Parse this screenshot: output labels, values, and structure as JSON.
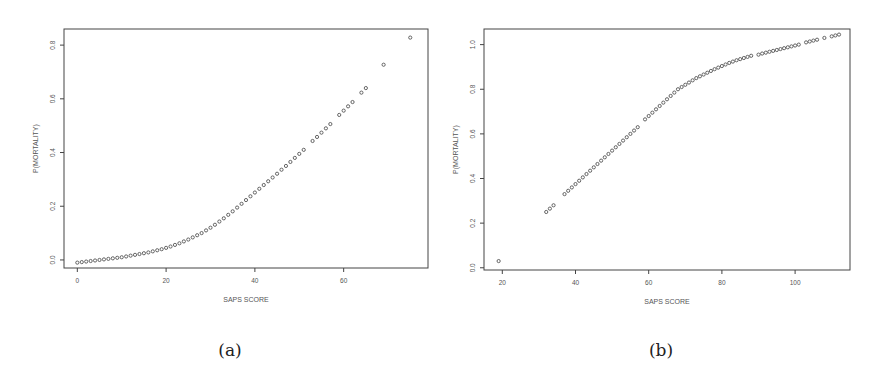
{
  "captions": {
    "a": "(a)",
    "b": "(b)"
  },
  "colors": {
    "frame": "#444444",
    "point": "#555555",
    "text": "#555555"
  },
  "chart_data": [
    {
      "type": "scatter",
      "title": "",
      "xlabel": "SAPS SCORE",
      "ylabel": "P(MORTALITY)",
      "xticks": [
        0,
        20,
        40,
        60
      ],
      "yticks": [
        0.0,
        0.2,
        0.4,
        0.6,
        0.8
      ],
      "xlim": [
        -3,
        79
      ],
      "ylim": [
        -0.03,
        0.86
      ],
      "grid": false,
      "legend": null,
      "x": [
        0,
        1,
        2,
        3,
        4,
        5,
        6,
        7,
        8,
        9,
        10,
        11,
        12,
        13,
        14,
        15,
        16,
        17,
        18,
        19,
        20,
        21,
        22,
        23,
        24,
        25,
        26,
        27,
        28,
        29,
        30,
        31,
        32,
        33,
        34,
        35,
        36,
        37,
        38,
        39,
        40,
        41,
        42,
        43,
        44,
        45,
        46,
        47,
        48,
        49,
        50,
        51,
        53,
        54,
        55,
        56,
        57,
        59,
        60,
        61,
        62,
        64,
        65,
        69,
        75
      ],
      "y": [
        -0.01,
        -0.008,
        -0.006,
        -0.004,
        -0.002,
        0.0,
        0.002,
        0.004,
        0.006,
        0.008,
        0.01,
        0.013,
        0.016,
        0.019,
        0.022,
        0.025,
        0.028,
        0.032,
        0.036,
        0.04,
        0.045,
        0.05,
        0.056,
        0.062,
        0.069,
        0.076,
        0.084,
        0.092,
        0.1,
        0.11,
        0.12,
        0.131,
        0.143,
        0.155,
        0.168,
        0.181,
        0.195,
        0.209,
        0.223,
        0.237,
        0.251,
        0.265,
        0.279,
        0.293,
        0.307,
        0.321,
        0.336,
        0.35,
        0.365,
        0.38,
        0.395,
        0.41,
        0.443,
        0.458,
        0.474,
        0.49,
        0.506,
        0.54,
        0.556,
        0.572,
        0.588,
        0.623,
        0.64,
        0.727,
        0.828
      ]
    },
    {
      "type": "scatter",
      "title": "",
      "xlabel": "SAPS SCORE",
      "ylabel": "P(MORTALITY)",
      "xticks": [
        20,
        40,
        60,
        80,
        100
      ],
      "yticks": [
        0.0,
        0.2,
        0.4,
        0.6,
        0.8,
        1.0
      ],
      "xlim": [
        15,
        115
      ],
      "ylim": [
        -0.01,
        1.07
      ],
      "grid": false,
      "legend": null,
      "x": [
        19,
        32,
        33,
        34,
        37,
        38,
        39,
        40,
        41,
        42,
        43,
        44,
        45,
        46,
        47,
        48,
        49,
        50,
        51,
        52,
        53,
        54,
        55,
        56,
        57,
        59,
        60,
        61,
        62,
        63,
        64,
        65,
        66,
        67,
        68,
        69,
        70,
        71,
        72,
        73,
        74,
        75,
        76,
        77,
        78,
        79,
        80,
        81,
        82,
        83,
        84,
        85,
        86,
        87,
        88,
        90,
        91,
        92,
        93,
        94,
        95,
        96,
        97,
        98,
        99,
        100,
        101,
        103,
        104,
        105,
        106,
        108,
        110,
        111,
        112
      ],
      "y": [
        0.03,
        0.25,
        0.265,
        0.28,
        0.33,
        0.345,
        0.36,
        0.375,
        0.39,
        0.405,
        0.42,
        0.435,
        0.45,
        0.465,
        0.48,
        0.495,
        0.51,
        0.525,
        0.54,
        0.555,
        0.57,
        0.585,
        0.6,
        0.615,
        0.63,
        0.665,
        0.68,
        0.695,
        0.71,
        0.725,
        0.74,
        0.755,
        0.77,
        0.785,
        0.8,
        0.81,
        0.82,
        0.83,
        0.84,
        0.85,
        0.858,
        0.866,
        0.874,
        0.882,
        0.89,
        0.897,
        0.904,
        0.911,
        0.918,
        0.924,
        0.93,
        0.935,
        0.94,
        0.945,
        0.95,
        0.955,
        0.96,
        0.964,
        0.968,
        0.972,
        0.976,
        0.98,
        0.984,
        0.988,
        0.992,
        0.996,
        1.0,
        1.01,
        1.014,
        1.018,
        1.022,
        1.03,
        1.037,
        1.041,
        1.045
      ]
    }
  ]
}
